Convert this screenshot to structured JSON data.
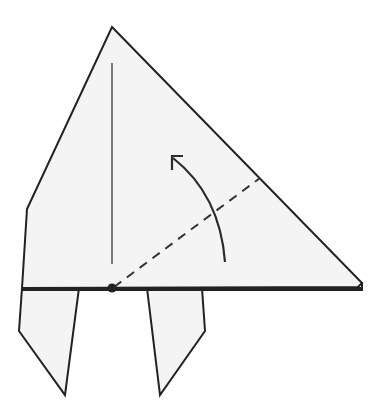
{
  "diagram": {
    "type": "origami-fold-step",
    "colors": {
      "paper_fill": "#f4f4f4",
      "line": "#222222",
      "background": "#ffffff"
    },
    "elements": {
      "main_body": {
        "points": [
          [
            112,
            27
          ],
          [
            362,
            283
          ],
          [
            22,
            288
          ],
          [
            27,
            209
          ]
        ]
      },
      "back_layer_tip": {
        "points": [
          [
            362,
            283
          ],
          [
            362,
            289
          ],
          [
            22,
            289
          ]
        ]
      },
      "left_leg": {
        "points": [
          [
            22,
            288
          ],
          [
            79,
            288
          ],
          [
            65,
            395
          ],
          [
            19,
            331
          ]
        ]
      },
      "right_leg": {
        "points": [
          [
            147,
            288
          ],
          [
            202,
            288
          ],
          [
            205,
            331
          ],
          [
            160,
            395
          ]
        ]
      },
      "center_crease": {
        "from": [
          112,
          63
        ],
        "to": [
          112,
          264
        ]
      },
      "valley_fold_line": {
        "from": [
          112,
          288
        ],
        "to": [
          260,
          178
        ],
        "style": "dashed"
      },
      "pivot_dot": {
        "center": [
          112,
          288
        ],
        "radius": 4.5
      },
      "fold_arrow": {
        "direction": "counter-clockwise",
        "from": [
          225,
          262
        ],
        "to": [
          172,
          157
        ]
      }
    }
  }
}
